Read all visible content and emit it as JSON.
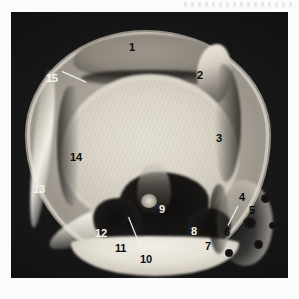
{
  "image": {
    "modality": "axial-knee-section",
    "frame": {
      "left": 11,
      "top": 12,
      "width": 277,
      "height": 266
    },
    "background_color": "#0a0a0a",
    "page_background": "#ffffff",
    "soft_tissue_color": "#a49e94",
    "bone_color": "#e3ddd1",
    "dark_structure_color": "#141312"
  },
  "annotations": {
    "title": "Numbered anatomical key",
    "count": 15,
    "items": [
      {
        "id": "1",
        "text": "1",
        "x": 129,
        "y": 42,
        "tone": "dark",
        "leader": null
      },
      {
        "id": "2",
        "text": "2",
        "x": 197,
        "y": 70,
        "tone": "dark",
        "leader": null
      },
      {
        "id": "3",
        "text": "3",
        "x": 216,
        "y": 133,
        "tone": "dark",
        "leader": null
      },
      {
        "id": "4",
        "text": "4",
        "x": 239,
        "y": 192,
        "tone": "dark",
        "leader": null
      },
      {
        "id": "5",
        "text": "5",
        "x": 249,
        "y": 205,
        "tone": "dark",
        "leader": null
      },
      {
        "id": "6",
        "text": "6",
        "x": 224,
        "y": 227,
        "tone": "dark",
        "leader": {
          "x": 228,
          "y": 225,
          "length": 22,
          "angle": -63,
          "style": "light"
        }
      },
      {
        "id": "7",
        "text": "7",
        "x": 205,
        "y": 241,
        "tone": "dark",
        "leader": null
      },
      {
        "id": "8",
        "text": "8",
        "x": 191,
        "y": 226,
        "tone": "light",
        "leader": null
      },
      {
        "id": "9",
        "text": "9",
        "x": 159,
        "y": 204,
        "tone": "light",
        "leader": null
      },
      {
        "id": "10",
        "text": "10",
        "x": 140,
        "y": 254,
        "tone": "dark",
        "leader": {
          "x": 142,
          "y": 250,
          "length": 36,
          "angle": -112,
          "style": "light"
        }
      },
      {
        "id": "11",
        "text": "11",
        "x": 115,
        "y": 243,
        "tone": "dark",
        "leader": null
      },
      {
        "id": "12",
        "text": "12",
        "x": 95,
        "y": 228,
        "tone": "light",
        "leader": null
      },
      {
        "id": "13",
        "text": "13",
        "x": 33,
        "y": 184,
        "tone": "light",
        "leader": null
      },
      {
        "id": "14",
        "text": "14",
        "x": 70,
        "y": 152,
        "tone": "dark",
        "leader": null
      },
      {
        "id": "15",
        "text": "15",
        "x": 46,
        "y": 73,
        "tone": "light",
        "leader": {
          "x": 62,
          "y": 71,
          "length": 26,
          "angle": 24,
          "style": "light"
        }
      }
    ]
  }
}
